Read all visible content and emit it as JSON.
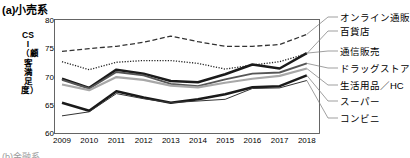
{
  "panel": {
    "title": "(a)小売系",
    "bottom_clipped_text": "(b)金融系"
  },
  "axes": {
    "y_axis_title": "CSI（顧客満足度）",
    "y_ticks": [
      "60",
      "65",
      "70",
      "75",
      "80"
    ],
    "x_ticks": [
      "2009",
      "2010",
      "2011",
      "2012",
      "2013",
      "2014",
      "2015",
      "2016",
      "2017",
      "2018"
    ]
  },
  "legend": {
    "items": [
      {
        "label": "オンライン通販"
      },
      {
        "label": "百貨店"
      },
      {
        "label": "通信販売"
      },
      {
        "label": "ドラッグストア"
      },
      {
        "label": "生活用品／HC"
      },
      {
        "label": "スーパー"
      },
      {
        "label": "コンビニ"
      }
    ]
  },
  "chart_data": {
    "type": "line",
    "title": "(a)小売系",
    "xlabel": "",
    "ylabel": "CSI（顧客満足度）",
    "x": [
      2009,
      2010,
      2011,
      2012,
      2013,
      2014,
      2015,
      2016,
      2017,
      2018
    ],
    "ylim": [
      60,
      80
    ],
    "xlim": [
      2009,
      2018
    ],
    "grid": false,
    "legend_position": "right-outside",
    "series": [
      {
        "name": "オンライン通販",
        "style": "dashed",
        "color": "#333333",
        "values": [
          74.4,
          74.9,
          75.3,
          76.0,
          77.1,
          76.1,
          75.3,
          75.3,
          75.6,
          77.4
        ]
      },
      {
        "name": "百貨店",
        "style": "dotted",
        "color": "#222222",
        "values": [
          72.6,
          71.2,
          72.5,
          72.8,
          72.8,
          72.3,
          71.3,
          72.0,
          72.6,
          74.0
        ]
      },
      {
        "name": "通信販売",
        "style": "solid-thick",
        "color": "#1a1a1a",
        "values": [
          69.6,
          68.0,
          71.2,
          70.5,
          69.2,
          69.0,
          70.4,
          72.1,
          71.4,
          74.1
        ]
      },
      {
        "name": "ドラッグストア",
        "style": "solid-medium",
        "color": "#555555",
        "values": [
          69.4,
          67.9,
          70.8,
          70.2,
          68.7,
          68.3,
          69.5,
          70.5,
          70.7,
          72.3
        ]
      },
      {
        "name": "生活用品／HC",
        "style": "solid-gray",
        "color": "#a8a8a8",
        "values": [
          68.6,
          67.6,
          69.9,
          69.4,
          68.4,
          68.1,
          68.9,
          69.6,
          70.1,
          71.4
        ]
      },
      {
        "name": "スーパー",
        "style": "solid-thick",
        "color": "#1a1a1a",
        "values": [
          65.4,
          64.0,
          67.4,
          66.3,
          65.4,
          66.0,
          66.9,
          68.1,
          68.3,
          70.2
        ]
      },
      {
        "name": "コンビニ",
        "style": "solid-thin",
        "color": "#333333",
        "values": [
          63.1,
          63.8,
          67.0,
          66.1,
          65.4,
          65.7,
          66.0,
          67.9,
          68.0,
          69.3
        ]
      }
    ]
  }
}
